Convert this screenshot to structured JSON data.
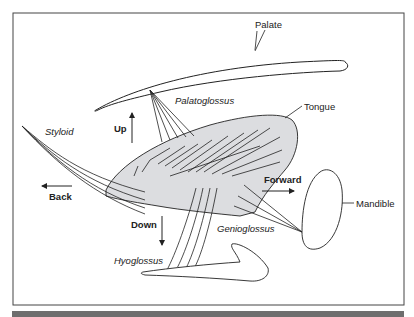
{
  "diagram": {
    "type": "anatomical tongue muscle diagram",
    "structures": {
      "palate": "Palate",
      "tongue": "Tongue",
      "mandible": "Mandible"
    },
    "muscles": {
      "palatoglossus": "Palatoglossus",
      "styloid": "Styloid",
      "genioglossus": "Genioglossus",
      "hyoglossus": "Hyoglossus"
    },
    "directions": {
      "up": "Up",
      "down": "Down",
      "back": "Back",
      "forward": "Forward"
    },
    "colors": {
      "line": "#222222",
      "tongue_fill": "#dcdde0",
      "frame": "#444444",
      "footer_bar": "#6e6e6e"
    }
  }
}
